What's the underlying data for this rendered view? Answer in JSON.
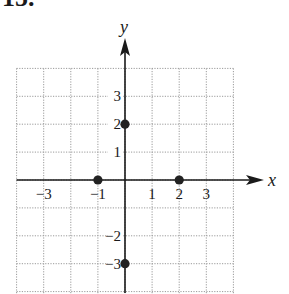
{
  "problem": {
    "number": "15."
  },
  "chart_data": {
    "type": "scatter",
    "title": "",
    "xlabel": "x",
    "ylabel": "y",
    "xlim": [
      -4,
      4
    ],
    "ylim": [
      -4,
      4
    ],
    "grid": true,
    "grid_style": "dotted",
    "x_ticks": [
      {
        "value": -3,
        "label": "−3"
      },
      {
        "value": -1,
        "label": "−1"
      },
      {
        "value": 1,
        "label": "1"
      },
      {
        "value": 2,
        "label": "2"
      },
      {
        "value": 3,
        "label": "3"
      }
    ],
    "y_ticks": [
      {
        "value": 3,
        "label": "3"
      },
      {
        "value": 2,
        "label": "2"
      },
      {
        "value": 1,
        "label": "1"
      },
      {
        "value": -2,
        "label": "−2"
      },
      {
        "value": -3,
        "label": "−3"
      }
    ],
    "points": [
      {
        "x": 0,
        "y": 2
      },
      {
        "x": -1,
        "y": 0
      },
      {
        "x": 2,
        "y": 0
      },
      {
        "x": 0,
        "y": -3
      }
    ],
    "colors": {
      "axis": "#1a1a1a",
      "grid": "#9a9a9a",
      "point": "#222222"
    }
  }
}
